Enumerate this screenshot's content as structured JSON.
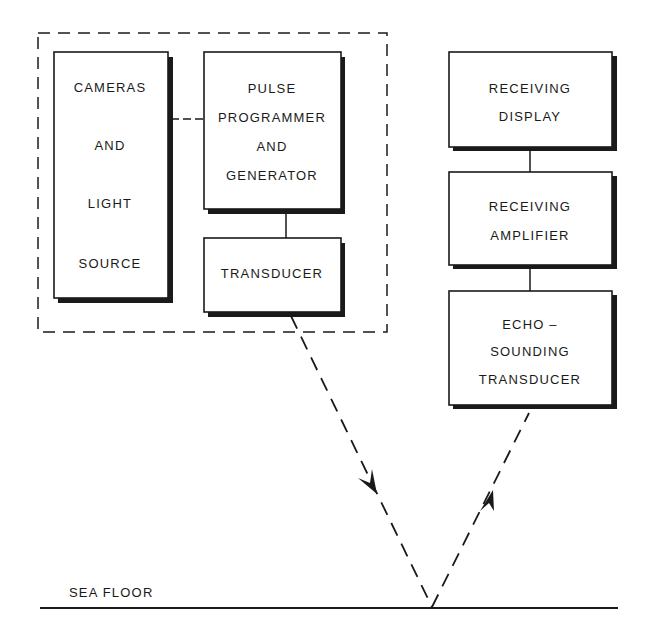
{
  "diagram": {
    "type": "block-diagram",
    "colors": {
      "ink": "#1a1a1a",
      "background": "#ffffff"
    },
    "enclosure": {
      "style": "dashed",
      "contains": [
        "cameras",
        "pulse_gen",
        "transducer"
      ]
    },
    "blocks": {
      "cameras": {
        "lines": [
          "CAMERAS",
          "AND",
          "LIGHT",
          "SOURCE"
        ]
      },
      "pulse_gen": {
        "lines": [
          "PULSE",
          "PROGRAMMER",
          "AND",
          "GENERATOR"
        ]
      },
      "transducer": {
        "lines": [
          "TRANSDUCER"
        ]
      },
      "rx_display": {
        "lines": [
          "RECEIVING",
          "DISPLAY"
        ]
      },
      "rx_amp": {
        "lines": [
          "RECEIVING",
          "AMPLIFIER"
        ]
      },
      "echo": {
        "lines": [
          "ECHO –",
          "SOUNDING",
          "TRANSDUCER"
        ]
      }
    },
    "connections": [
      {
        "from": "cameras",
        "to": "pulse_gen",
        "style": "dashed"
      },
      {
        "from": "pulse_gen",
        "to": "transducer",
        "style": "solid"
      },
      {
        "from": "rx_display",
        "to": "rx_amp",
        "style": "solid"
      },
      {
        "from": "rx_amp",
        "to": "echo",
        "style": "solid"
      },
      {
        "from": "transducer",
        "to": "sea_floor",
        "style": "dashed",
        "arrow": "down"
      },
      {
        "from": "sea_floor",
        "to": "echo",
        "style": "dashed",
        "arrow": "up"
      }
    ],
    "sea_floor": {
      "label": "SEA FLOOR"
    }
  }
}
